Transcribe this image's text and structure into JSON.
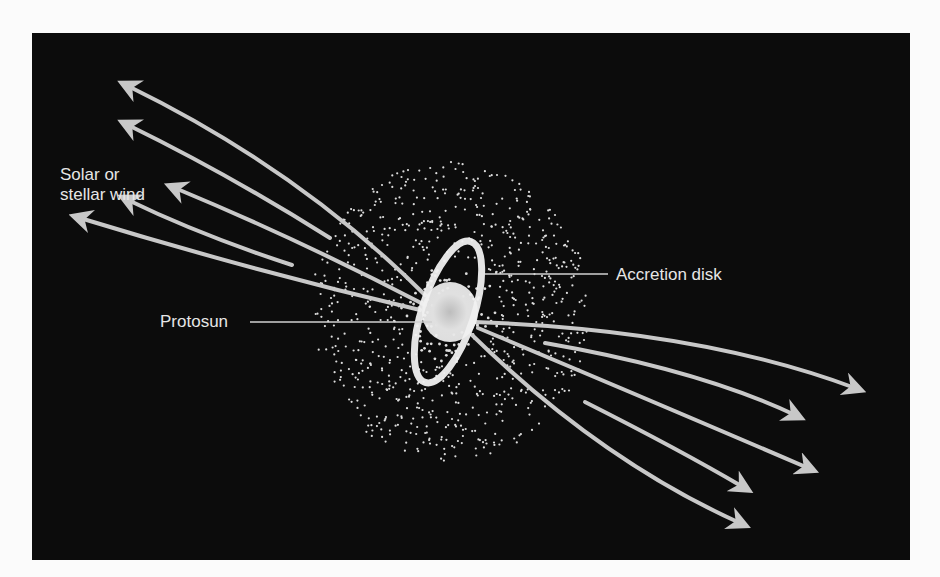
{
  "diagram": {
    "labels": {
      "wind_line1": "Solar or",
      "wind_line2": "stellar wind",
      "accretion_disk": "Accretion disk",
      "protosun": "Protosun"
    },
    "colors": {
      "background": "#0c0c0c",
      "arrows": "#c8c8c8",
      "text": "#e6e6e6",
      "page": "#fbfbfb"
    }
  }
}
